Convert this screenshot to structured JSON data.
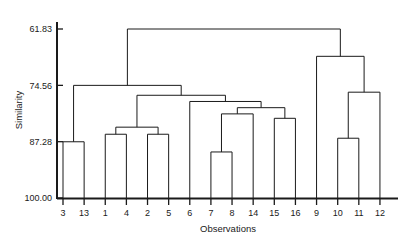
{
  "chart_data": {
    "type": "dendrogram",
    "title": "",
    "xlabel": "Observations",
    "ylabel": "Similarity",
    "y_ticks": [
      61.83,
      74.56,
      87.28,
      100.0
    ],
    "y_tick_labels": [
      "61.83",
      "74.56",
      "87.28",
      "100.00"
    ],
    "ylim": [
      61.83,
      100.0
    ],
    "y_axis_inverted": true,
    "grid": false,
    "legend": null,
    "leaf_order": [
      "3",
      "13",
      "1",
      "4",
      "2",
      "5",
      "6",
      "7",
      "8",
      "14",
      "15",
      "16",
      "9",
      "10",
      "11",
      "12"
    ],
    "leaf_count": 16,
    "line_color": "#1a1a1a",
    "merges": [
      {
        "id": "m1",
        "left": "3",
        "right": "13",
        "similarity": 87.3,
        "label": "3-13"
      },
      {
        "id": "m2",
        "left": "1",
        "right": "4",
        "similarity": 85.6,
        "label": "1-4"
      },
      {
        "id": "m3",
        "left": "2",
        "right": "5",
        "similarity": 85.6,
        "label": "2-5"
      },
      {
        "id": "m4",
        "left": "m2",
        "right": "m3",
        "similarity": 84.0,
        "label": "1-4-2-5"
      },
      {
        "id": "m5",
        "left": "7",
        "right": "8",
        "similarity": 89.6,
        "label": "7-8"
      },
      {
        "id": "m6",
        "left": "m5",
        "right": "14",
        "similarity": 81.0,
        "label": "7-8-14"
      },
      {
        "id": "m7",
        "left": "15",
        "right": "16",
        "similarity": 82.0,
        "label": "15-16"
      },
      {
        "id": "m8",
        "left": "m6",
        "right": "m7",
        "similarity": 79.6,
        "label": "7-8-14-15-16"
      },
      {
        "id": "m9",
        "left": "6",
        "right": "m8",
        "similarity": 78.2,
        "label": "6-cluster"
      },
      {
        "id": "m10",
        "left": "m4",
        "right": "m9",
        "similarity": 76.8,
        "label": "mid-cluster"
      },
      {
        "id": "m11",
        "left": "m1",
        "right": "m10",
        "similarity": 74.56,
        "label": "left-branch"
      },
      {
        "id": "m12",
        "left": "10",
        "right": "11",
        "similarity": 86.5,
        "label": "10-11"
      },
      {
        "id": "m13",
        "left": "m12",
        "right": "12",
        "similarity": 76.1,
        "label": "10-11-12"
      },
      {
        "id": "m14",
        "left": "9",
        "right": "m13",
        "similarity": 68.0,
        "label": "right-branch"
      },
      {
        "id": "m15",
        "left": "m11",
        "right": "m14",
        "similarity": 61.83,
        "label": "root"
      }
    ]
  }
}
